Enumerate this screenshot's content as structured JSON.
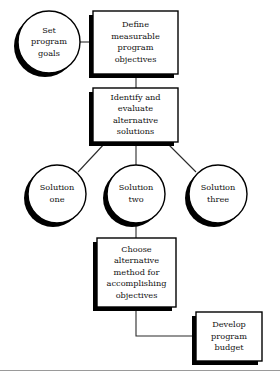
{
  "diagram": {
    "type": "flowchart",
    "background_color": "#ffffff",
    "line_color": "#2a2a2a",
    "shape_stroke_color": "#000000",
    "shape_fill_color": "#ffffff",
    "shadow_color": "#000000",
    "footer_rule_color": "#9a9a9a",
    "nodes": [
      {
        "id": "set-goals",
        "shape": "circle",
        "lines": [
          "Set",
          "program",
          "goals"
        ],
        "cx": 49,
        "cy": 42,
        "r": 31
      },
      {
        "id": "define-objectives",
        "shape": "rect",
        "lines": [
          "Define",
          "measurable",
          "program",
          "objectives"
        ],
        "x": 93,
        "y": 11,
        "w": 85,
        "h": 63
      },
      {
        "id": "identify-evaluate",
        "shape": "rect",
        "lines": [
          "Identify and",
          "evaluate",
          "alternative",
          "solutions"
        ],
        "x": 93,
        "y": 88,
        "w": 85,
        "h": 54
      },
      {
        "id": "solution-one",
        "shape": "circle",
        "lines": [
          "Solution",
          "one"
        ],
        "cx": 57,
        "cy": 194,
        "r": 29
      },
      {
        "id": "solution-two",
        "shape": "circle",
        "lines": [
          "Solution",
          "two"
        ],
        "cx": 136,
        "cy": 194,
        "r": 29
      },
      {
        "id": "solution-three",
        "shape": "circle",
        "lines": [
          "Solution",
          "three"
        ],
        "cx": 218,
        "cy": 194,
        "r": 29
      },
      {
        "id": "choose-alternative",
        "shape": "rect",
        "lines": [
          "Choose",
          "alternative",
          "method for",
          "accomplishing",
          "objectives"
        ],
        "x": 97,
        "y": 238,
        "w": 79,
        "h": 69
      },
      {
        "id": "develop-budget",
        "shape": "rect",
        "lines": [
          "Develop",
          "program",
          "budget"
        ],
        "x": 196,
        "y": 312,
        "w": 66,
        "h": 49
      }
    ],
    "connectors": [
      {
        "id": "goals-to-objectives",
        "from": "set-goals",
        "to": "define-objectives",
        "path": "M 80 42 L 93 42"
      },
      {
        "id": "objectives-to-identify",
        "from": "define-objectives",
        "to": "identify-evaluate",
        "path": "M 136 74 L 136 88"
      },
      {
        "id": "identify-to-solution-one",
        "from": "identify-evaluate",
        "to": "solution-one",
        "path": "M 106 142 L 78 172"
      },
      {
        "id": "identify-to-solution-two",
        "from": "identify-evaluate",
        "to": "solution-two",
        "path": "M 136 142 L 136 165"
      },
      {
        "id": "identify-to-solution-three",
        "from": "identify-evaluate",
        "to": "solution-three",
        "path": "M 166 142 L 196 172"
      },
      {
        "id": "solution-two-to-choose",
        "from": "solution-two",
        "to": "choose-alternative",
        "path": "M 136 223 L 136 238"
      },
      {
        "id": "choose-to-budget",
        "from": "choose-alternative",
        "to": "develop-budget",
        "path": "M 136 307 L 136 336 L 196 336"
      }
    ]
  }
}
